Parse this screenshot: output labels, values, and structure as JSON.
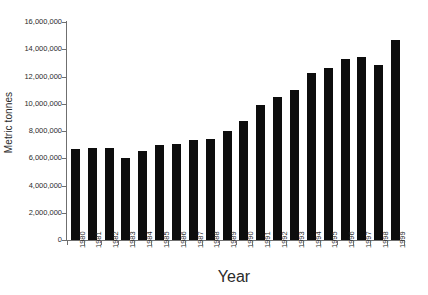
{
  "chart_data": {
    "type": "bar",
    "title": "",
    "subtitle": "",
    "xlabel": "Year",
    "ylabel": "Metric tonnes",
    "categories": [
      "1980",
      "1981",
      "1982",
      "1983",
      "1984",
      "1985",
      "1986",
      "1987",
      "1988",
      "1989",
      "1990",
      "1991",
      "1992",
      "1993",
      "1994",
      "1995",
      "1996",
      "1997",
      "1998",
      "1999"
    ],
    "values": [
      6700000,
      6720000,
      6720000,
      6050000,
      6500000,
      6970000,
      7080000,
      7330000,
      7420000,
      7990000,
      8760000,
      9880000,
      10520000,
      11030000,
      12230000,
      12650000,
      13280000,
      13450000,
      12880000,
      14700000
    ],
    "ylim": [
      0,
      16000000
    ],
    "ytick_values": [
      0,
      2000000,
      4000000,
      6000000,
      8000000,
      10000000,
      12000000,
      14000000,
      16000000
    ],
    "ytick_labels": [
      "0",
      "2,000,000",
      "4,000,000",
      "6,000,000",
      "8,000,000",
      "10,000,000",
      "12,000,000",
      "14,000,000",
      "16,000,000"
    ],
    "grid": false,
    "legend": false,
    "bar_color": "#0d0d0d",
    "axis_color": "#6f6f6f",
    "background_color": "#ffffff"
  }
}
